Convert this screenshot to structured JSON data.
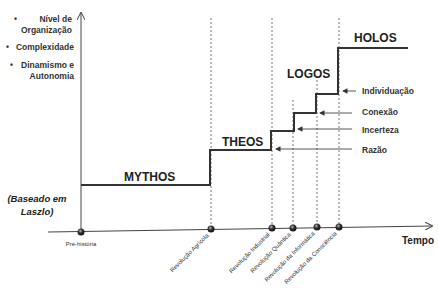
{
  "y_axis_labels": [
    {
      "bullet": "•",
      "lines": [
        "Nível de",
        "Organização"
      ]
    },
    {
      "bullet": "•",
      "lines": [
        "Complexidade"
      ]
    },
    {
      "bullet": "•",
      "lines": [
        "Dinamismo e",
        "Autonomia"
      ]
    }
  ],
  "source_note": {
    "line1": "(Baseado em",
    "line2": "Laszlo)"
  },
  "x_axis_label": "Tempo",
  "eras": {
    "mythos": "MYTHOS",
    "theos": "THEOS",
    "logos": "LOGOS",
    "holos": "HOLOS"
  },
  "sub_stages": {
    "razao": "Razão",
    "incerteza": "Incerteza",
    "conexao": "Conexão",
    "individuacao": "Individuação"
  },
  "milestones": [
    "Pré-história",
    "Revolução Agrícola",
    "Revolução Industrial",
    "Revolução Quântica",
    "Revolução da Informática",
    "Revolução da Consciência"
  ],
  "colors": {
    "line": "#333333",
    "dotted": "#555555",
    "text": "#222222",
    "background": "#ffffff"
  }
}
